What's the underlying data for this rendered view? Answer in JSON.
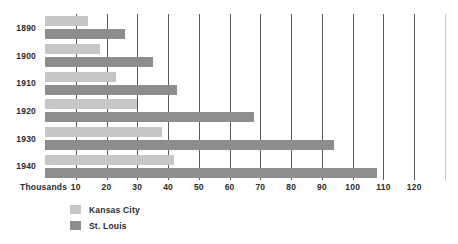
{
  "chart_data": {
    "type": "bar",
    "orientation": "horizontal",
    "title": "",
    "xlabel": "Thousands",
    "ylabel": "",
    "categories": [
      "1890",
      "1900",
      "1910",
      "1920",
      "1930",
      "1940"
    ],
    "series": [
      {
        "name": "Kansas City",
        "color": "#c6c6c6",
        "values": [
          14,
          18,
          23,
          30,
          38,
          42
        ]
      },
      {
        "name": "St. Louis",
        "color": "#8d8d8d",
        "values": [
          26,
          35,
          43,
          68,
          94,
          108
        ]
      }
    ],
    "xlim": [
      0,
      130
    ],
    "xticks": [
      10,
      20,
      30,
      40,
      50,
      60,
      70,
      80,
      90,
      100,
      110,
      120
    ],
    "xtick_labels": [
      "10",
      "20",
      "30",
      "40",
      "50",
      "60",
      "70",
      "80",
      "90",
      "100",
      "110",
      "120"
    ],
    "grid": true,
    "grid_axis": "x",
    "legend_position": "bottom-left",
    "legend_entries": [
      "Kansas City",
      "St. Louis"
    ],
    "annotations": []
  },
  "axis": {
    "unit_label": "Thousands"
  },
  "legend": {
    "items": [
      {
        "label": "Kansas City"
      },
      {
        "label": "St. Louis"
      }
    ]
  }
}
